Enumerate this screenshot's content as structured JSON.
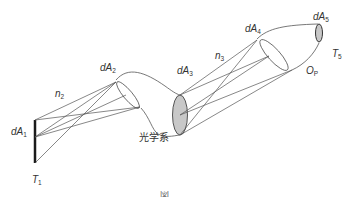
{
  "diagram": {
    "title": "光学系",
    "labels": {
      "dA1": {
        "base": "dA",
        "sub": "1"
      },
      "dA2": {
        "base": "dA",
        "sub": "2"
      },
      "dA3": {
        "base": "dA",
        "sub": "3"
      },
      "dA4": {
        "base": "dA",
        "sub": "4"
      },
      "dA5": {
        "base": "dA",
        "sub": "5"
      },
      "n2": {
        "base": "n",
        "sub": "2"
      },
      "n3": {
        "base": "n",
        "sub": "3"
      },
      "T1": {
        "base": "T",
        "sub": "1"
      },
      "T5": {
        "base": "T",
        "sub": "5"
      },
      "OP": {
        "base": "O",
        "sub": "P"
      }
    },
    "optical_system_label": "光学系",
    "caption_fragment": "図"
  },
  "colors": {
    "line": "#555555",
    "fill_gray": "#c8c8c8",
    "source_bar": "#1a1a1a",
    "text": "#333333"
  }
}
